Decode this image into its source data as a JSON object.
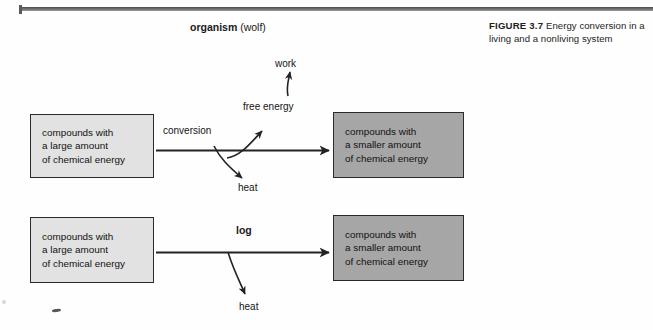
{
  "figure": {
    "caption_label": "FIGURE 3.7",
    "caption_text": "Energy conversion in a living and a nonliving system"
  },
  "rule": {
    "color": "#5a5a5a"
  },
  "diagrams": [
    {
      "id": "organism",
      "title_strong": "organism",
      "title_light": " (wolf)",
      "source_box": {
        "text": "compounds with\na large amount\nof chemical energy",
        "fill": "#e2e2e2"
      },
      "product_box": {
        "text": "compounds with\na smaller amount\nof chemical energy",
        "fill": "#a6a6a6"
      },
      "process_label": "conversion",
      "branch_up_label": "free energy",
      "branch_up_output_label": "work",
      "branch_down_label": "heat"
    },
    {
      "id": "log",
      "title_strong": "log",
      "title_light": "",
      "source_box": {
        "text": "compounds with\na large amount\nof chemical energy",
        "fill": "#e2e2e2"
      },
      "product_box": {
        "text": "compounds with\na smaller amount\nof chemical energy",
        "fill": "#a6a6a6"
      },
      "process_label": "",
      "branch_down_label": "heat"
    }
  ],
  "colors": {
    "ink": "#1a1a1a",
    "light_box": "#e2e2e2",
    "dark_box": "#a6a6a6",
    "rule": "#5a5a5a",
    "page": "#fefefe"
  }
}
